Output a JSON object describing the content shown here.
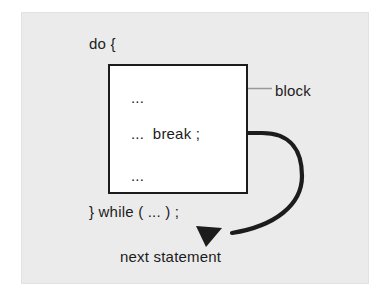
{
  "figure": {
    "kind": "control-flow-diagram",
    "background_color": "#ffffff",
    "panel_color": "#ebebeb",
    "ink_color": "#1c1c1c",
    "annotation_color": "#999999",
    "block_fill": "#ffffff"
  },
  "code": {
    "do_line": "do {",
    "ellipsis_top": "...",
    "break_line": "...  break ;",
    "ellipsis_bottom": "...",
    "while_line": "} while ( ... ) ;",
    "next_statement": "next statement"
  },
  "annotations": {
    "block_label": "block"
  },
  "diagram_data": {
    "type": "diagram",
    "nodes": [
      {
        "id": "do-line",
        "label": "do {",
        "x": 89,
        "y": 36
      },
      {
        "id": "block-box",
        "label": "block",
        "x": 108,
        "y": 64,
        "width": 140,
        "height": 130
      },
      {
        "id": "ellipsis-top",
        "label": "...",
        "x": 131,
        "y": 90
      },
      {
        "id": "break-line",
        "label": "...  break ;",
        "x": 131,
        "y": 126
      },
      {
        "id": "ellipsis-bottom",
        "label": "...",
        "x": 131,
        "y": 168
      },
      {
        "id": "while-line",
        "label": "} while ( ... ) ;",
        "x": 89,
        "y": 204
      },
      {
        "id": "next-statement",
        "label": "next statement",
        "x": 120,
        "y": 249
      },
      {
        "id": "block-label",
        "label": "block",
        "x": 275,
        "y": 83
      }
    ],
    "edges": [
      {
        "id": "break-jump-arrow",
        "from": "break-line",
        "to": "next-statement",
        "style": "thick-curved",
        "arrowhead": "down",
        "color": "#1c1c1c"
      },
      {
        "id": "block-pointer",
        "from": "block-label",
        "to": "block-box",
        "style": "thin-leader",
        "arrowhead": "left",
        "color": "#999999"
      }
    ]
  }
}
